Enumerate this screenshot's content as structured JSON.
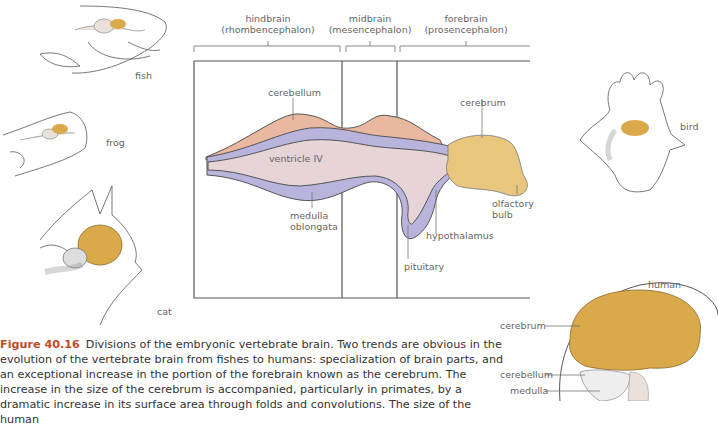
{
  "divisions": [
    {
      "name": "hindbrain",
      "term": "(rhombencephalon)"
    },
    {
      "name": "midbrain",
      "term": "(mesencephalon)"
    },
    {
      "name": "forebrain",
      "term": "(prosencephalon)"
    }
  ],
  "embryo_labels": {
    "cerebellum": "cerebellum",
    "ventricle": "ventricle IV",
    "medulla": "medulla\noblongata",
    "cerebrum": "cerebrum",
    "olfactory": "olfactory\nbulb",
    "hypothalamus": "hypothalamus",
    "pituitary": "pituitary"
  },
  "animals": {
    "fish": "fish",
    "frog": "frog",
    "cat": "cat",
    "bird": "bird",
    "human": "human"
  },
  "human_labels": {
    "cerebrum": "cerebrum",
    "cerebellum": "cerebellum",
    "medulla": "medulla"
  },
  "caption": {
    "figure_number": "Figure 40.16",
    "text": "Divisions of the embryonic vertebrate brain. Two trends are obvious in the evolution of the vertebrate brain from fishes to humans: specialization of brain parts, and an exceptional increase in the portion of the forebrain known as the cerebrum. The increase in the size of the cerebrum is accompanied, particularly in primates, by a dramatic increase in its surface area through folds and convolutions. The size of the human"
  },
  "colors": {
    "cerebrum": "#d9a94a",
    "cerebellum": "#e9b8a0",
    "ventricle": "#e7d4d6",
    "wall": "#b9b4dc",
    "caption_accent": "#c24a2c"
  }
}
